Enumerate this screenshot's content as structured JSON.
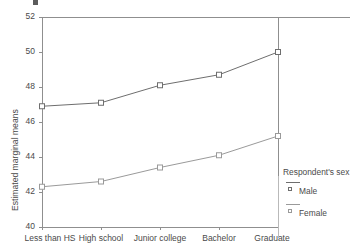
{
  "chart_data": {
    "type": "line",
    "title": "",
    "xlabel": "",
    "ylabel": "Estimated marginal means",
    "categories": [
      "Less than HS",
      "High school",
      "Junior college",
      "Bachelor",
      "Graduate"
    ],
    "ylim": [
      40,
      52
    ],
    "yticks": [
      40,
      42,
      44,
      46,
      48,
      50,
      52
    ],
    "grid": false,
    "legend_position": "right",
    "legend_title": "Respondent's sex",
    "series": [
      {
        "name": "Male",
        "color": "#6e6e6e",
        "marker": "open-square",
        "values": [
          46.9,
          47.1,
          48.1,
          48.7,
          50.0
        ]
      },
      {
        "name": "Female",
        "color": "#9a9a9a",
        "marker": "open-square",
        "values": [
          42.3,
          42.6,
          43.4,
          44.1,
          45.2
        ]
      }
    ]
  },
  "axes": {
    "y_title": "Estimated marginal means",
    "y_tick_labels": [
      "52",
      "50",
      "48",
      "46",
      "44",
      "42",
      "40"
    ],
    "x_tick_labels": [
      "Less than HS",
      "High school",
      "Junior college",
      "Bachelor",
      "Graduate"
    ]
  },
  "legend": {
    "title": "Respondent's sex",
    "entries": [
      {
        "label": "Male"
      },
      {
        "label": "Female"
      }
    ]
  },
  "colors": {
    "male_line": "#6e6e6e",
    "female_line": "#9a9a9a",
    "axis": "#8f8f8f",
    "text": "#4a4a4a"
  }
}
